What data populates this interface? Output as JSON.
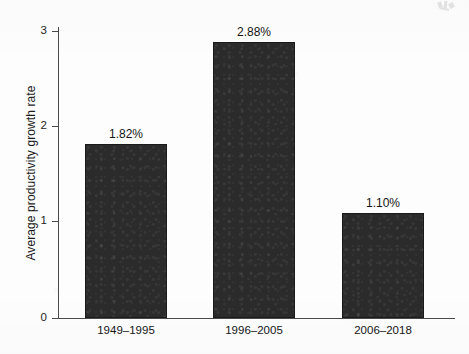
{
  "chart_data": {
    "type": "bar",
    "title": "",
    "subtitle": "",
    "xlabel": "",
    "ylabel": "Average productivity growth rate",
    "categories": [
      "1949–1995",
      "1996–2005",
      "2006–2018"
    ],
    "values": [
      1.82,
      2.88,
      1.1
    ],
    "value_labels": [
      "1.82%",
      "2.88%",
      "1.10%"
    ],
    "ylim": [
      0,
      3.05
    ],
    "y_ticks": [
      0,
      1,
      2,
      3
    ],
    "y_tick_labels": [
      "0",
      "1",
      "2",
      "3"
    ],
    "grid": false,
    "legend": null,
    "legend_position": "none",
    "bar_color": "#2b2b2b",
    "axis_color": "#4a4a4a",
    "text_color": "#151515",
    "background_color": "#ffffff",
    "annotations": []
  }
}
